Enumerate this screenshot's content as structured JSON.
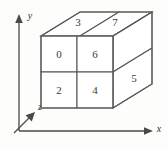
{
  "figure": {
    "background_color": "#fdfdfc",
    "line_color": "#5a5a5a",
    "axis_color": "#4a4a4a",
    "label_color": "#3a3a3a"
  },
  "axes": [
    {
      "name": "y-axis",
      "label": "y",
      "direction": "up"
    },
    {
      "name": "x-axis",
      "label": "x",
      "direction": "right"
    },
    {
      "name": "z-axis",
      "label": "z",
      "direction": "up-right"
    }
  ],
  "cube": {
    "faces": [
      {
        "id": "front-top-left",
        "label": "0",
        "surface": "front"
      },
      {
        "id": "front-top-right",
        "label": "6",
        "surface": "front"
      },
      {
        "id": "front-bottom-left",
        "label": "2",
        "surface": "front"
      },
      {
        "id": "front-bottom-right",
        "label": "4",
        "surface": "front"
      },
      {
        "id": "top-left",
        "label": "3",
        "surface": "top"
      },
      {
        "id": "top-right",
        "label": "7",
        "surface": "top"
      },
      {
        "id": "side-lower",
        "label": "5",
        "surface": "right"
      }
    ]
  }
}
